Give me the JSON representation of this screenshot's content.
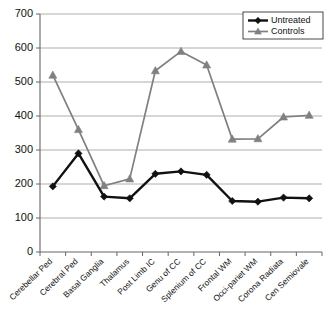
{
  "chart_data": {
    "type": "line",
    "title": "",
    "xlabel": "",
    "ylabel": "",
    "ylim": [
      0,
      700
    ],
    "ytick_step": 100,
    "yticks": [
      "0",
      "100",
      "200",
      "300",
      "400",
      "500",
      "600",
      "700"
    ],
    "grid": true,
    "legend_position": "top-right",
    "categories": [
      "Cerebellar Ped",
      "Cerebral Ped",
      "Basal Ganglia",
      "Thalamus",
      "Post Limb IC",
      "Genu of CC",
      "Splenium of CC",
      "Frontal WM",
      "Occi-pariet WM",
      "Corona Radiata",
      "Cen Semiovale"
    ],
    "series": [
      {
        "name": "Untreated",
        "color": "#111111",
        "marker": "diamond",
        "values": [
          193,
          290,
          163,
          158,
          230,
          237,
          227,
          150,
          148,
          160,
          158
        ]
      },
      {
        "name": "Controls",
        "color": "#808080",
        "marker": "triangle",
        "values": [
          520,
          360,
          195,
          215,
          533,
          590,
          550,
          332,
          333,
          397,
          402
        ]
      }
    ]
  },
  "legend": {
    "items": [
      {
        "label": "Untreated"
      },
      {
        "label": "Controls"
      }
    ]
  },
  "caption": {
    "text": ""
  }
}
